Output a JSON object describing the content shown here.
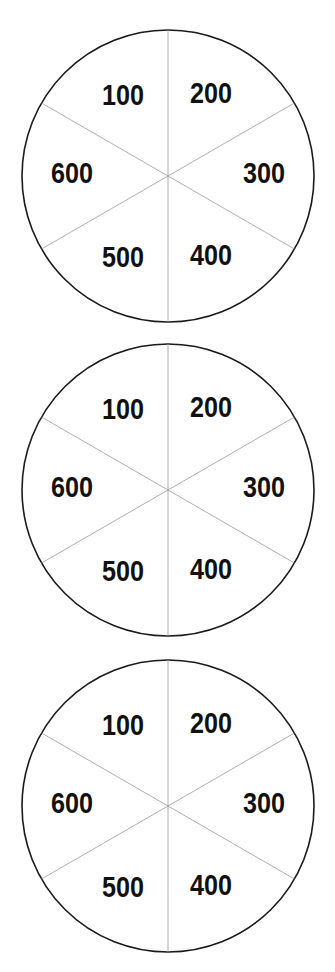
{
  "wheels": [
    {
      "cx": 168,
      "cy": 176,
      "r": 146,
      "segments": [
        "100",
        "200",
        "300",
        "400",
        "500",
        "600"
      ]
    },
    {
      "cx": 168,
      "cy": 490,
      "r": 146,
      "segments": [
        "100",
        "200",
        "300",
        "400",
        "500",
        "600"
      ]
    },
    {
      "cx": 168,
      "cy": 806,
      "r": 146,
      "segments": [
        "100",
        "200",
        "300",
        "400",
        "500",
        "600"
      ]
    }
  ],
  "colors": {
    "rim": "#1a1a1a",
    "spoke": "#9a9a9a",
    "text": "#111111",
    "background": "#ffffff"
  }
}
